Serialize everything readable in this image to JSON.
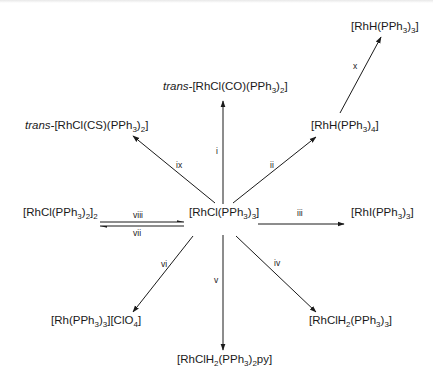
{
  "diagram": {
    "type": "reaction-scheme",
    "center": {
      "id": "c0",
      "prefix": "",
      "parts": [
        "[RhCl(PPh",
        "3",
        ")",
        "3",
        "]"
      ]
    },
    "compounds": [
      {
        "id": "c1",
        "prefix": "trans-",
        "parts": [
          "[RhCl(CO)(PPh",
          "3",
          ")",
          "2",
          "]"
        ]
      },
      {
        "id": "c2",
        "prefix": "",
        "parts": [
          "[RhH(PPh",
          "3",
          ")",
          "4",
          "]"
        ]
      },
      {
        "id": "c3",
        "prefix": "",
        "parts": [
          "[RhH(PPh",
          "3",
          ")",
          "3",
          "]"
        ]
      },
      {
        "id": "c4",
        "prefix": "trans-",
        "parts": [
          "[RhCl(CS)(PPh",
          "3",
          ")",
          "2",
          "]"
        ]
      },
      {
        "id": "c5",
        "prefix": "",
        "parts": [
          "[RhCl(PPh",
          "3",
          ")",
          "2",
          "]",
          "2",
          ""
        ]
      },
      {
        "id": "c6",
        "prefix": "",
        "parts": [
          "[RhI(PPh",
          "3",
          ")",
          "3",
          "]"
        ]
      },
      {
        "id": "c7",
        "prefix": "",
        "parts": [
          "[Rh(PPh",
          "3",
          ")",
          "3",
          "][ClO",
          "4",
          "]"
        ]
      },
      {
        "id": "c8",
        "prefix": "",
        "parts": [
          "[RhClH",
          "2",
          "(PPh",
          "3",
          ")",
          "2",
          "py]"
        ]
      },
      {
        "id": "c9",
        "prefix": "",
        "parts": [
          "[RhClH",
          "2",
          "(PPh",
          "3",
          ")",
          "3",
          "]"
        ]
      }
    ],
    "arrows": [
      {
        "label": "i",
        "from": "[RhCl(PPh3)3]",
        "to": "trans-[RhCl(CO)(PPh3)2]"
      },
      {
        "label": "ii",
        "from": "[RhCl(PPh3)3]",
        "to": "[RhH(PPh3)4]"
      },
      {
        "label": "iii",
        "from": "[RhCl(PPh3)3]",
        "to": "[RhI(PPh3)3]"
      },
      {
        "label": "iv",
        "from": "[RhCl(PPh3)3]",
        "to": "[RhClH2(PPh3)3]"
      },
      {
        "label": "v",
        "from": "[RhCl(PPh3)3]",
        "to": "[RhClH2(PPh3)2py]"
      },
      {
        "label": "vi",
        "from": "[RhCl(PPh3)3]",
        "to": "[Rh(PPh3)3][ClO4]"
      },
      {
        "label": "vii",
        "from": "[RhCl(PPh3)3]",
        "to": "[RhCl(PPh3)2]2"
      },
      {
        "label": "viii",
        "from": "[RhCl(PPh3)2]2",
        "to": "[RhCl(PPh3)3]"
      },
      {
        "label": "ix",
        "from": "[RhCl(PPh3)3]",
        "to": "trans-[RhCl(CS)(PPh3)2]"
      },
      {
        "label": "x",
        "from": "[RhH(PPh3)4]",
        "to": "[RhH(PPh3)3]"
      }
    ]
  }
}
